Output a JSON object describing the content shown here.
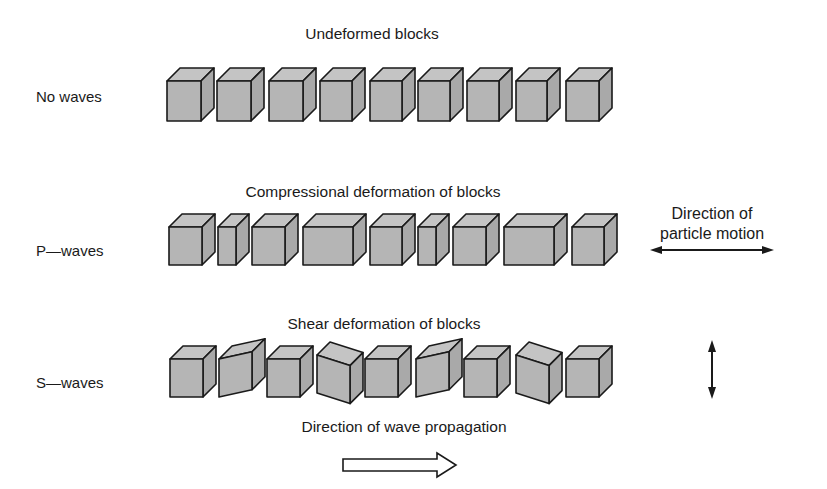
{
  "figure": {
    "rows": [
      {
        "id": "no-waves",
        "row_label": "No waves",
        "caption": "Undeformed blocks",
        "blocks": [
          {
            "x": 167,
            "w": 34,
            "shear": 0
          },
          {
            "x": 217,
            "w": 34,
            "shear": 0
          },
          {
            "x": 269,
            "w": 34,
            "shear": 0
          },
          {
            "x": 320,
            "w": 32,
            "shear": 0
          },
          {
            "x": 370,
            "w": 32,
            "shear": 0
          },
          {
            "x": 418,
            "w": 32,
            "shear": 0
          },
          {
            "x": 467,
            "w": 32,
            "shear": 0
          },
          {
            "x": 516,
            "w": 31,
            "shear": 0
          },
          {
            "x": 566,
            "w": 33,
            "shear": 0
          }
        ]
      },
      {
        "id": "p-waves",
        "row_label": "P—waves",
        "caption": "Compressional deformation of blocks",
        "motion_label": [
          "Direction of",
          "particle motion"
        ],
        "motion_arrow": "horizontal-double-arrow",
        "blocks": [
          {
            "x": 169,
            "w": 33,
            "shear": 0
          },
          {
            "x": 218,
            "w": 18,
            "shear": 0
          },
          {
            "x": 252,
            "w": 33,
            "shear": 0
          },
          {
            "x": 303,
            "w": 50,
            "shear": 0
          },
          {
            "x": 370,
            "w": 32,
            "shear": 0
          },
          {
            "x": 418,
            "w": 18,
            "shear": 0
          },
          {
            "x": 453,
            "w": 33,
            "shear": 0
          },
          {
            "x": 504,
            "w": 50,
            "shear": 0
          },
          {
            "x": 572,
            "w": 32,
            "shear": 0
          }
        ]
      },
      {
        "id": "s-waves",
        "row_label": "S—waves",
        "caption": "Shear deformation of blocks",
        "motion_arrow": "vertical-double-arrow",
        "blocks": [
          {
            "x": 170,
            "w": 33,
            "shear": 0
          },
          {
            "x": 219,
            "w": 33,
            "shear": -12
          },
          {
            "x": 267,
            "w": 33,
            "shear": 0
          },
          {
            "x": 317,
            "w": 33,
            "shear": 11
          },
          {
            "x": 365,
            "w": 33,
            "shear": 0
          },
          {
            "x": 416,
            "w": 33,
            "shear": -12
          },
          {
            "x": 464,
            "w": 33,
            "shear": 0
          },
          {
            "x": 516,
            "w": 33,
            "shear": 11
          },
          {
            "x": 566,
            "w": 33,
            "shear": 0
          }
        ]
      }
    ],
    "propagation_label": "Direction of wave propagation",
    "propagation_arrow": "hollow-right-arrow",
    "colors": {
      "block_fill": "#b5b5b5",
      "block_top": "#c4c4c4",
      "block_side": "#a9a9a9",
      "stroke": "#1a1a1a",
      "background": "#ffffff"
    }
  }
}
